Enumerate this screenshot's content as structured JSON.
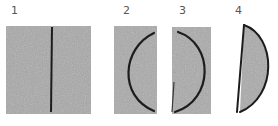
{
  "figure": {
    "panels": [
      {
        "label": "1",
        "shape": "square-with-straight-line"
      },
      {
        "label": "2",
        "shape": "rectangle-with-arc-bulging-left"
      },
      {
        "label": "3",
        "shape": "cut-piece-with-arc-bulging-right"
      },
      {
        "label": "4",
        "shape": "half-disc-d-shape"
      }
    ],
    "colors": {
      "tile": "#a9a9a9",
      "tile_light": "#b8b8b8",
      "line": "#1e1e1e",
      "label": "#555555",
      "background": "#ffffff"
    }
  }
}
